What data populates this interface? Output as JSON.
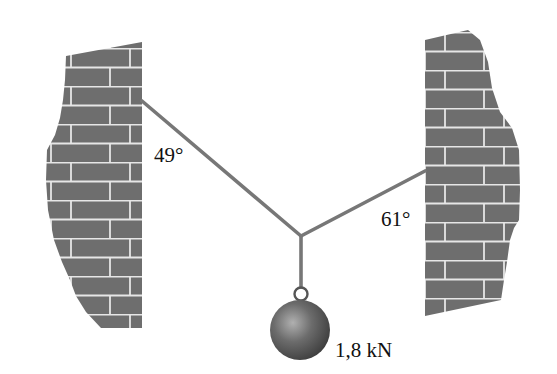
{
  "figure": {
    "type": "statics-free-body-setup"
  },
  "labels": {
    "left_angle": "49°",
    "right_angle": "61°",
    "weight": "1,8 kN"
  },
  "colors": {
    "wall": "#6e6e6e",
    "mortar": "#e6e6e6",
    "cable": "#777777",
    "ball": "#5a5a5a",
    "text": "#111111"
  }
}
